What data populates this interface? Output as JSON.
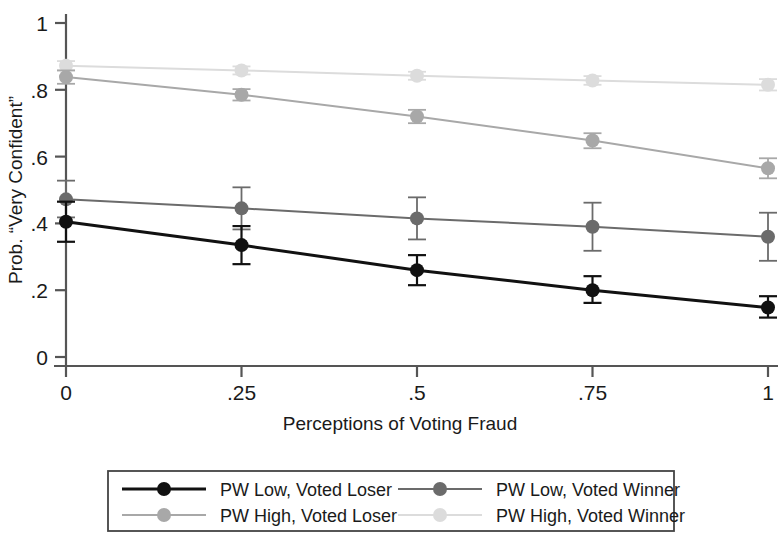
{
  "chart_data": {
    "type": "line",
    "title": "",
    "subtitle": "",
    "xlabel": "Perceptions of Voting Fraud",
    "ylabel": "Prob. “Very Confident”",
    "x": [
      0,
      0.25,
      0.5,
      0.75,
      1
    ],
    "xtick_labels": [
      "0",
      ".25",
      ".5",
      ".75",
      "1"
    ],
    "ytick_labels": [
      "0",
      ".2",
      ".4",
      ".6",
      ".8",
      "1"
    ],
    "ytick_values": [
      0,
      0.2,
      0.4,
      0.6,
      0.8,
      1
    ],
    "xlim": [
      -0.04,
      1.04
    ],
    "ylim": [
      0,
      1
    ],
    "grid": false,
    "legend_position": "bottom",
    "legend_columns": 2,
    "series": [
      {
        "name": "PW Low, Voted Loser",
        "color": "#111111",
        "marker": "circle",
        "values": [
          0.405,
          0.335,
          0.26,
          0.2,
          0.148
        ],
        "ci_low": [
          0.345,
          0.278,
          0.215,
          0.162,
          0.118
        ],
        "ci_high": [
          0.465,
          0.392,
          0.305,
          0.242,
          0.182
        ]
      },
      {
        "name": "PW Low, Voted Winner",
        "color": "#6b6b6b",
        "marker": "circle",
        "values": [
          0.472,
          0.445,
          0.415,
          0.39,
          0.36
        ],
        "ci_low": [
          0.418,
          0.382,
          0.352,
          0.318,
          0.288
        ],
        "ci_high": [
          0.528,
          0.508,
          0.478,
          0.462,
          0.432
        ]
      },
      {
        "name": "PW High, Voted Loser",
        "color": "#a8a8a8",
        "marker": "circle",
        "values": [
          0.838,
          0.785,
          0.72,
          0.648,
          0.565
        ],
        "ci_low": [
          0.818,
          0.768,
          0.7,
          0.625,
          0.535
        ],
        "ci_high": [
          0.858,
          0.802,
          0.74,
          0.67,
          0.595
        ]
      },
      {
        "name": "PW High, Voted Winner",
        "color": "#dcdcdc",
        "marker": "circle",
        "values": [
          0.872,
          0.858,
          0.842,
          0.828,
          0.815
        ],
        "ci_low": [
          0.858,
          0.846,
          0.83,
          0.815,
          0.798
        ],
        "ci_high": [
          0.886,
          0.87,
          0.854,
          0.841,
          0.832
        ]
      }
    ]
  },
  "legend": {
    "items": [
      {
        "label": "PW Low, Voted Loser",
        "color": "#111111"
      },
      {
        "label": "PW Low, Voted Winner",
        "color": "#6b6b6b"
      },
      {
        "label": "PW High, Voted Loser",
        "color": "#a8a8a8"
      },
      {
        "label": "PW High, Voted Winner",
        "color": "#dcdcdc"
      }
    ]
  },
  "colors": {
    "axis": "#555555",
    "text": "#1a1a1a",
    "background": "#ffffff",
    "legend_border": "#444444"
  }
}
